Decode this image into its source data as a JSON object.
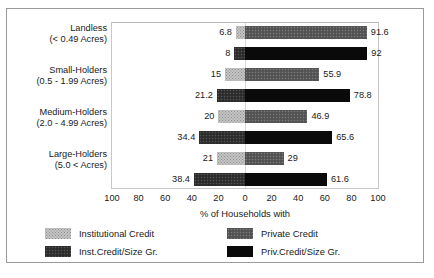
{
  "chart_data": {
    "type": "bar",
    "orientation": "horizontal-diverging",
    "title": "",
    "xlabel": "% of Households with",
    "ylabel": "",
    "xlim": [
      -100,
      100
    ],
    "xticks": [
      100,
      80,
      60,
      40,
      20,
      0,
      20,
      40,
      60,
      80,
      100
    ],
    "grid": false,
    "legend_position": "bottom",
    "categories": [
      "Landless",
      "Small-Holders",
      "Medium-Holders",
      "Large-Holders"
    ],
    "category_ranges": [
      "(< 0.49 Acres)",
      "(0.5 - 1.99 Acres)",
      "(2.0 - 4.99 Acres)",
      "(5.0 < Acres)"
    ],
    "series": [
      {
        "name": "Institutional Credit",
        "side": "left",
        "row": "upper",
        "color": "#c4c4c4",
        "values": [
          6.8,
          15,
          20,
          21
        ]
      },
      {
        "name": "Private Credit",
        "side": "right",
        "row": "upper",
        "color": "#595959",
        "values": [
          91.6,
          55.9,
          46.9,
          29
        ]
      },
      {
        "name": "Inst.Credit/Size Gr.",
        "side": "left",
        "row": "lower",
        "color": "#333333",
        "values": [
          8,
          21.2,
          34.4,
          38.4
        ]
      },
      {
        "name": "Priv.Credit/Size Gr.",
        "side": "right",
        "row": "lower",
        "color": "#0a0a0a",
        "values": [
          92,
          78.8,
          65.6,
          61.6
        ]
      }
    ],
    "data_labels": {
      "landless": {
        "inst": "6.8",
        "priv": "91.6",
        "inst_sg": "8",
        "priv_sg": "92"
      },
      "small": {
        "inst": "15",
        "priv": "55.9",
        "inst_sg": "21.2",
        "priv_sg": "78.8"
      },
      "medium": {
        "inst": "20",
        "priv": "46.9",
        "inst_sg": "34.4",
        "priv_sg": "65.6"
      },
      "large": {
        "inst": "21",
        "priv": "29",
        "inst_sg": "38.4",
        "priv_sg": "61.6"
      }
    }
  },
  "axis": {
    "title": "% of Households with",
    "tick_labels": [
      "100",
      "80",
      "60",
      "40",
      "20",
      "0",
      "20",
      "40",
      "60",
      "80",
      "100"
    ]
  },
  "legend": {
    "items": [
      {
        "label": "Institutional Credit",
        "swatch": "inst-swatch"
      },
      {
        "label": "Private Credit",
        "swatch": "priv-swatch"
      },
      {
        "label": "Inst.Credit/Size Gr.",
        "swatch": "inst-sg-swatch"
      },
      {
        "label": "Priv.Credit/Size Gr.",
        "swatch": "priv-sg-swatch"
      }
    ]
  }
}
